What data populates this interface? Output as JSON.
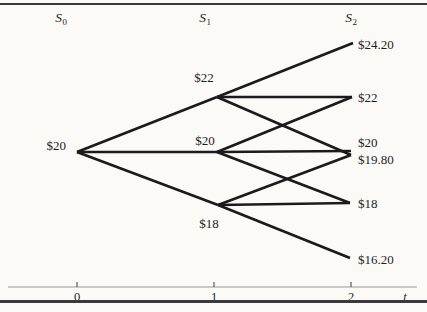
{
  "figure": {
    "colors": {
      "background": "#fbfaf7",
      "tree_line": "#1b1b1b",
      "rule": "#3a3a3a",
      "axis_line": "#9a9a9a",
      "tick": "#5a5a5a",
      "text": "#1d1d1d"
    },
    "line_width": 2.7,
    "column_headers": [
      {
        "base": "S",
        "sub": "0",
        "x": 61,
        "y": 11
      },
      {
        "base": "S",
        "sub": "1",
        "x": 205,
        "y": 11
      },
      {
        "base": "S",
        "sub": "2",
        "x": 351,
        "y": 11
      }
    ],
    "nodes": [
      {
        "id": "S0",
        "label": "$20",
        "vx": 77,
        "vy": 152,
        "lx": 66,
        "ly": 145,
        "anchor": "end"
      },
      {
        "id": "S1u",
        "label": "$22",
        "vx": 217,
        "vy": 97,
        "lx": 204,
        "ly": 77,
        "anchor": "middle"
      },
      {
        "id": "S1m",
        "label": "$20",
        "vx": 217,
        "vy": 152,
        "lx": 205,
        "ly": 140,
        "anchor": "middle"
      },
      {
        "id": "S1d",
        "label": "$18",
        "vx": 218,
        "vy": 205,
        "lx": 209,
        "ly": 223,
        "anchor": "middle"
      },
      {
        "id": "S2uu",
        "label": "$24.20",
        "vx": 353,
        "vy": 43,
        "lx": 358,
        "ly": 44,
        "anchor": "start"
      },
      {
        "id": "S2um",
        "label": "$22",
        "vx": 352,
        "vy": 97,
        "lx": 358,
        "ly": 97,
        "anchor": "start"
      },
      {
        "id": "S2mm",
        "label": "$20",
        "vx": 351,
        "vy": 151,
        "lx": 358,
        "ly": 142,
        "anchor": "start"
      },
      {
        "id": "S2ud",
        "label": "$19.80",
        "vx": 351,
        "vy": 155,
        "lx": 358,
        "ly": 159,
        "anchor": "start"
      },
      {
        "id": "S2md",
        "label": "$18",
        "vx": 350,
        "vy": 203,
        "lx": 358,
        "ly": 203,
        "anchor": "start"
      },
      {
        "id": "S2dd",
        "label": "$16.20",
        "vx": 350,
        "vy": 258,
        "lx": 358,
        "ly": 259,
        "anchor": "start"
      }
    ],
    "edges": [
      [
        "S0",
        "S1u"
      ],
      [
        "S0",
        "S1m"
      ],
      [
        "S0",
        "S1d"
      ],
      [
        "S1u",
        "S2uu"
      ],
      [
        "S1u",
        "S2um"
      ],
      [
        "S1u",
        "S2ud"
      ],
      [
        "S1m",
        "S2um"
      ],
      [
        "S1m",
        "S2mm"
      ],
      [
        "S1m",
        "S2md"
      ],
      [
        "S1d",
        "S2ud"
      ],
      [
        "S1d",
        "S2md"
      ],
      [
        "S1d",
        "S2dd"
      ]
    ],
    "rules": {
      "top": {
        "y": 3,
        "height": 2.4
      },
      "bottom": {
        "y": 300,
        "height": 2.8
      }
    },
    "time_axis": {
      "line_y": 287,
      "x1": 8,
      "x2": 417,
      "tick_len": 5,
      "ticks": [
        {
          "label": "0",
          "x": 77
        },
        {
          "label": "1",
          "x": 214
        },
        {
          "label": "2",
          "x": 351
        }
      ],
      "labels_y": 291,
      "var_label": "t",
      "var_x": 405
    }
  }
}
